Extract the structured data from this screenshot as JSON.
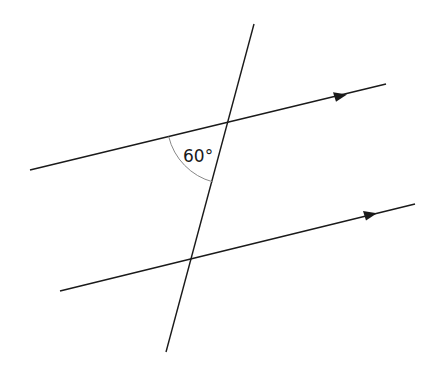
{
  "diagram": {
    "title": "",
    "type": "parallel lines cut by a transversal",
    "angle_label": "60°",
    "colors": {
      "line": "#1a1a1a",
      "arc": "#888888",
      "background": "#ffffff"
    },
    "lines": [
      {
        "name": "upper-parallel-line",
        "x1": 30,
        "y1": 170,
        "x2": 386,
        "y2": 84,
        "arrow": true
      },
      {
        "name": "lower-parallel-line",
        "x1": 60,
        "y1": 291,
        "x2": 415,
        "y2": 204,
        "arrow": true
      },
      {
        "name": "transversal-line",
        "x1": 254,
        "y1": 24,
        "x2": 166,
        "y2": 352,
        "arrow": false
      }
    ],
    "intersections": [
      {
        "name": "upper",
        "x": 229,
        "y": 122
      },
      {
        "name": "lower",
        "x": 190,
        "y": 259
      }
    ]
  }
}
